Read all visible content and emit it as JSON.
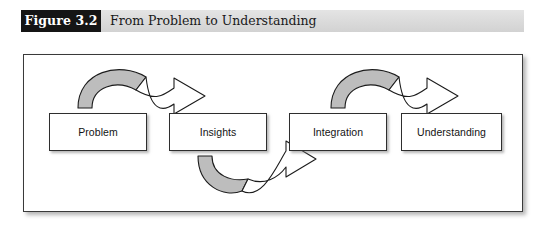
{
  "figure": {
    "number_label": "Figure 3.2",
    "caption": "From Problem to Understanding",
    "label_bg_color": "#151515",
    "label_text_color": "#ffffff",
    "caption_bar_color": "#dcdcdc",
    "panel_bg_color": "#ffffff",
    "panel_border_color": "#3a3a3a"
  },
  "diagram": {
    "type": "process-flow",
    "arrow_fill_gray": "#bdbdbd",
    "arrow_fill_white": "#ffffff",
    "arrow_stroke": "#1c1c1c",
    "nodes": [
      {
        "id": "problem",
        "label": "Problem",
        "x": 25,
        "y": 58,
        "w": 98,
        "h": 38
      },
      {
        "id": "insights",
        "label": "Insights",
        "x": 145,
        "y": 58,
        "w": 98,
        "h": 38
      },
      {
        "id": "integration",
        "label": "Integration",
        "x": 265,
        "y": 58,
        "w": 98,
        "h": 38
      },
      {
        "id": "understanding",
        "label": "Understanding",
        "x": 377,
        "y": 58,
        "w": 101,
        "h": 38
      }
    ],
    "arrows": [
      {
        "id": "problem-to-insights",
        "from": "problem",
        "to": "insights",
        "direction": "over-top"
      },
      {
        "id": "insights-to-integration",
        "from": "insights",
        "to": "integration",
        "direction": "under-bottom"
      },
      {
        "id": "integration-to-understanding",
        "from": "integration",
        "to": "understanding",
        "direction": "over-top"
      }
    ]
  }
}
